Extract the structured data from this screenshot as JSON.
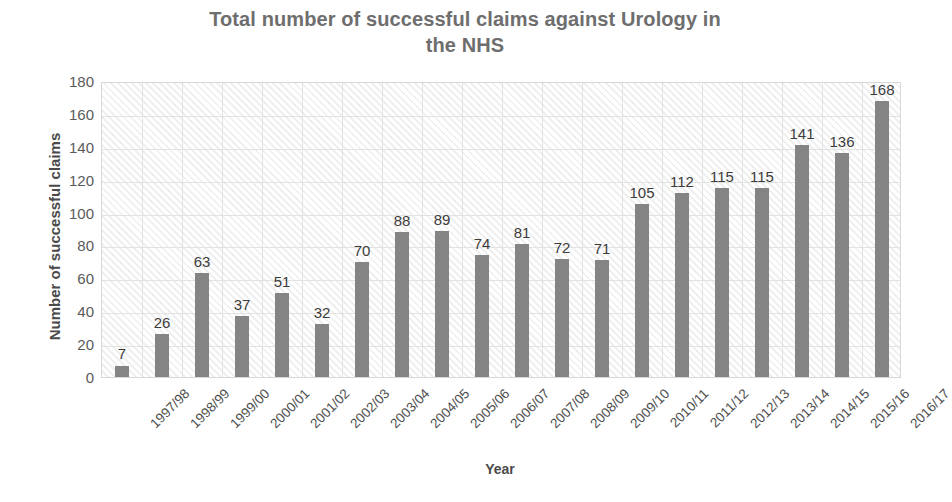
{
  "chart_data": {
    "type": "bar",
    "title": "Total number of successful claims against Urology in the NHS",
    "title_lines": [
      "Total number of successful claims against Urology in",
      "the NHS"
    ],
    "xlabel": "Year",
    "ylabel": "Number of successful claims",
    "ylim": [
      0,
      180
    ],
    "ytick_step": 20,
    "yticks": [
      "180",
      "160",
      "140",
      "120",
      "100",
      "80",
      "60",
      "40",
      "20",
      "0"
    ],
    "grid": "both",
    "legend": "none",
    "bar_color": "#848484",
    "plot_background": "#ffffff",
    "plot_pattern": "diagonal-hatch",
    "gridline_color": "#e2e2e2",
    "title_color": "#6e6e6e",
    "axis_title_color": "#4a4a4a",
    "categories": [
      "1997/98",
      "1998/99",
      "1999/00",
      "2000/01",
      "2001/02",
      "2002/03",
      "2003/04",
      "2004/05",
      "2005/06",
      "2006/07",
      "2007/08",
      "2008/09",
      "2009/10",
      "2010/11",
      "2011/12",
      "2012/13",
      "2013/14",
      "2014/15",
      "2015/16",
      "2016/17"
    ],
    "values": [
      7,
      26,
      63,
      37,
      51,
      32,
      70,
      88,
      89,
      74,
      81,
      72,
      71,
      105,
      112,
      115,
      115,
      141,
      136,
      168
    ],
    "value_labels": [
      "7",
      "26",
      "63",
      "37",
      "51",
      "32",
      "70",
      "88",
      "89",
      "74",
      "81",
      "72",
      "71",
      "105",
      "112",
      "115",
      "115",
      "141",
      "136",
      "168"
    ]
  }
}
